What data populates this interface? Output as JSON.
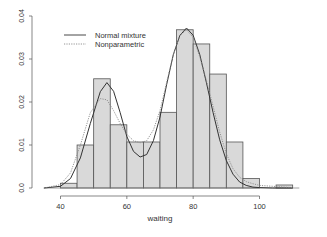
{
  "chart_data": {
    "type": "bar",
    "subtype": "histogram-with-density-curves",
    "title": "",
    "xlabel": "waiting",
    "ylabel": "",
    "xlim": [
      35,
      112
    ],
    "ylim": [
      0,
      0.04
    ],
    "x_ticks": [
      40,
      60,
      80,
      100
    ],
    "y_ticks": [
      0.0,
      0.01,
      0.02,
      0.03,
      0.04
    ],
    "y_tick_labels": [
      "0.0",
      "0.01",
      "0.02",
      "0.03",
      "0.04"
    ],
    "grid": false,
    "bin_width": 5,
    "bins": [
      {
        "from": 40,
        "to": 45,
        "density": 0.0011
      },
      {
        "from": 45,
        "to": 50,
        "density": 0.01
      },
      {
        "from": 50,
        "to": 55,
        "density": 0.0254
      },
      {
        "from": 55,
        "to": 60,
        "density": 0.0147
      },
      {
        "from": 60,
        "to": 65,
        "density": 0.0107
      },
      {
        "from": 65,
        "to": 70,
        "density": 0.0107
      },
      {
        "from": 70,
        "to": 75,
        "density": 0.0176
      },
      {
        "from": 75,
        "to": 80,
        "density": 0.0368
      },
      {
        "from": 80,
        "to": 85,
        "density": 0.0335
      },
      {
        "from": 85,
        "to": 90,
        "density": 0.0265
      },
      {
        "from": 90,
        "to": 95,
        "density": 0.0107
      },
      {
        "from": 95,
        "to": 100,
        "density": 0.0022
      },
      {
        "from": 100,
        "to": 105,
        "density": 0.0
      },
      {
        "from": 105,
        "to": 110,
        "density": 0.0007
      }
    ],
    "series": [
      {
        "name": "Normal mixture",
        "style": "solid",
        "x": [
          35,
          40,
          43,
          46,
          49,
          52,
          54,
          56,
          58,
          60,
          62,
          64,
          66,
          68,
          70,
          72,
          74,
          76,
          78,
          80,
          82,
          84,
          86,
          88,
          90,
          92,
          94,
          96,
          98,
          100,
          104,
          110
        ],
        "values": [
          0.0,
          0.0004,
          0.0022,
          0.007,
          0.015,
          0.0224,
          0.0245,
          0.0225,
          0.0175,
          0.012,
          0.0085,
          0.0072,
          0.0078,
          0.011,
          0.0165,
          0.024,
          0.031,
          0.0355,
          0.0372,
          0.0355,
          0.031,
          0.0245,
          0.0175,
          0.0112,
          0.0064,
          0.0032,
          0.0014,
          0.0006,
          0.0002,
          0.0001,
          0.0,
          0.0
        ]
      },
      {
        "name": "Nonparametric",
        "style": "dotted",
        "x": [
          35,
          40,
          43,
          46,
          49,
          52,
          54,
          56,
          58,
          60,
          62,
          64,
          66,
          68,
          70,
          72,
          74,
          76,
          78,
          80,
          82,
          84,
          86,
          88,
          90,
          92,
          94,
          96,
          98,
          100,
          104,
          110
        ],
        "values": [
          0.0,
          0.0008,
          0.0035,
          0.01,
          0.0175,
          0.0208,
          0.0205,
          0.018,
          0.015,
          0.0125,
          0.011,
          0.0105,
          0.011,
          0.0135,
          0.018,
          0.0245,
          0.031,
          0.0355,
          0.0368,
          0.035,
          0.0305,
          0.025,
          0.019,
          0.013,
          0.008,
          0.0045,
          0.0025,
          0.0015,
          0.001,
          0.0006,
          0.0004,
          0.0001
        ]
      }
    ],
    "legend": {
      "position": "top-left",
      "entries": [
        "Normal mixture",
        "Nonparametric"
      ]
    }
  },
  "colors": {
    "bar_fill": "#d9d9d9",
    "bar_stroke": "#555555",
    "axis": "#555555",
    "normal_line": "#333333",
    "nonparam_line": "#888888"
  }
}
